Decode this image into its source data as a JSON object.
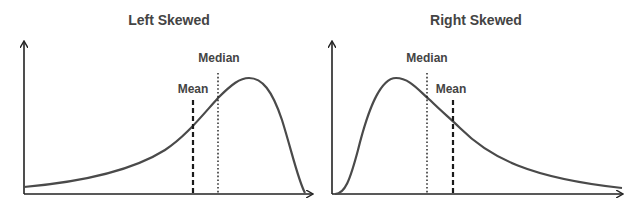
{
  "charts": [
    {
      "id": "left",
      "title": "Left Skewed",
      "labels": {
        "mean": "Mean",
        "median": "Median"
      },
      "order_left_to_right": [
        "Mean",
        "Median",
        "Mode (peak)"
      ]
    },
    {
      "id": "right",
      "title": "Right Skewed",
      "labels": {
        "mean": "Mean",
        "median": "Median"
      },
      "order_left_to_right": [
        "Mode (peak)",
        "Median",
        "Mean"
      ]
    }
  ],
  "colors": {
    "curve": "#4a4a4a",
    "axis": "#222222",
    "text": "#444444",
    "background": "#ffffff"
  },
  "line_styles": {
    "mean": "dashed",
    "median": "dotted"
  }
}
